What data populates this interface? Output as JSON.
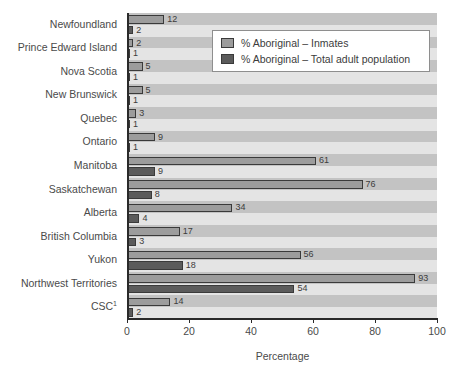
{
  "chart_data": {
    "type": "bar",
    "orientation": "horizontal",
    "title": "",
    "xlabel": "Percentage",
    "ylabel": "",
    "xlim": [
      0,
      100
    ],
    "xticks": [
      0,
      20,
      40,
      60,
      80,
      100
    ],
    "grid": false,
    "grid_style": "alternating horizontal bands",
    "legend_position": "upper right inside plot",
    "categories": [
      "Newfoundland",
      "Prince Edward Island",
      "Nova Scotia",
      "New Brunswick",
      "Quebec",
      "Ontario",
      "Manitoba",
      "Saskatchewan",
      "Alberta",
      "British Columbia",
      "Yukon",
      "Northwest Territories",
      "CSC"
    ],
    "category_superscripts": [
      "",
      "",
      "",
      "",
      "",
      "",
      "",
      "",
      "",
      "",
      "",
      "",
      "1"
    ],
    "series": [
      {
        "name": "% Aboriginal – Inmates",
        "color": "#9c9c9c",
        "values": [
          12,
          2,
          5,
          5,
          3,
          9,
          61,
          76,
          34,
          17,
          56,
          93,
          14
        ]
      },
      {
        "name": "% Aboriginal – Total adult population",
        "color": "#5b5b5b",
        "values": [
          2,
          1,
          1,
          1,
          1,
          1,
          9,
          8,
          4,
          3,
          18,
          54,
          2
        ]
      }
    ]
  },
  "legend": {
    "items": [
      {
        "label": "% Aboriginal – Inmates"
      },
      {
        "label": "% Aboriginal – Total adult population"
      }
    ]
  },
  "axes": {
    "x_title": "Percentage",
    "x_tick_labels": [
      "0",
      "20",
      "40",
      "60",
      "80",
      "100"
    ]
  },
  "colors": {
    "inmates": "#9c9c9c",
    "population": "#5b5b5b",
    "band_dark": "#c3c3c3",
    "band_light": "#e4e4e4",
    "axis": "#2a2a2a",
    "text": "#4a4a4a",
    "page_background": "#ffffff"
  }
}
